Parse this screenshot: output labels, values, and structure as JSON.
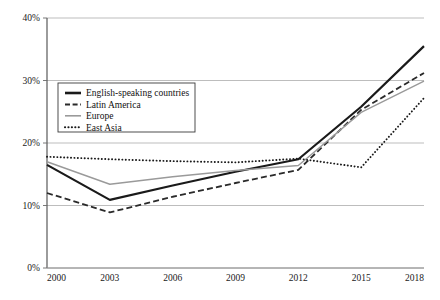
{
  "chart_data": {
    "type": "line",
    "title": "",
    "xlabel": "",
    "ylabel": "",
    "x": [
      2000,
      2003,
      2006,
      2009,
      2012,
      2015,
      2018
    ],
    "categories": [
      "2000",
      "2003",
      "2006",
      "2009",
      "2012",
      "2015",
      "2018"
    ],
    "xlim": [
      2000,
      2018
    ],
    "ylim": [
      0,
      40
    ],
    "y_ticks": [
      0,
      10,
      20,
      30,
      40
    ],
    "y_tick_labels": [
      "0%",
      "10%",
      "20%",
      "30%",
      "40%"
    ],
    "x_tick_labels": [
      "2000",
      "2003",
      "2006",
      "2009",
      "2012",
      "2015",
      "2018"
    ],
    "grid": true,
    "grid_axis": "y",
    "legend_position": "upper-left-inside",
    "series": [
      {
        "name": "English-speaking countries",
        "values": [
          16.5,
          10.9,
          13.2,
          15.4,
          17.4,
          25.8,
          35.5
        ],
        "style": "solid",
        "color": "#1a1a1a",
        "width": 2.2
      },
      {
        "name": "Latin America",
        "values": [
          12.0,
          8.9,
          11.4,
          13.6,
          15.7,
          25.3,
          31.2
        ],
        "style": "dashed",
        "color": "#2a2a2a",
        "width": 1.8
      },
      {
        "name": "Europe",
        "values": [
          17.0,
          13.4,
          14.6,
          15.6,
          16.4,
          24.9,
          29.9
        ],
        "style": "solid",
        "color": "#9a9a9a",
        "width": 1.4
      },
      {
        "name": "East Asia",
        "values": [
          17.8,
          17.4,
          17.1,
          16.9,
          17.5,
          16.1,
          27.2
        ],
        "style": "dotted",
        "color": "#1a1a1a",
        "width": 1.9
      }
    ]
  },
  "legend": {
    "items": [
      {
        "label": "English-speaking countries"
      },
      {
        "label": "Latin America"
      },
      {
        "label": "Europe"
      },
      {
        "label": "East Asia"
      }
    ]
  },
  "axes": {
    "y_labels": [
      "40%",
      "30%",
      "20%",
      "10%",
      "0%"
    ],
    "x_labels": [
      "2000",
      "2003",
      "2006",
      "2009",
      "2012",
      "2015",
      "2018"
    ]
  }
}
